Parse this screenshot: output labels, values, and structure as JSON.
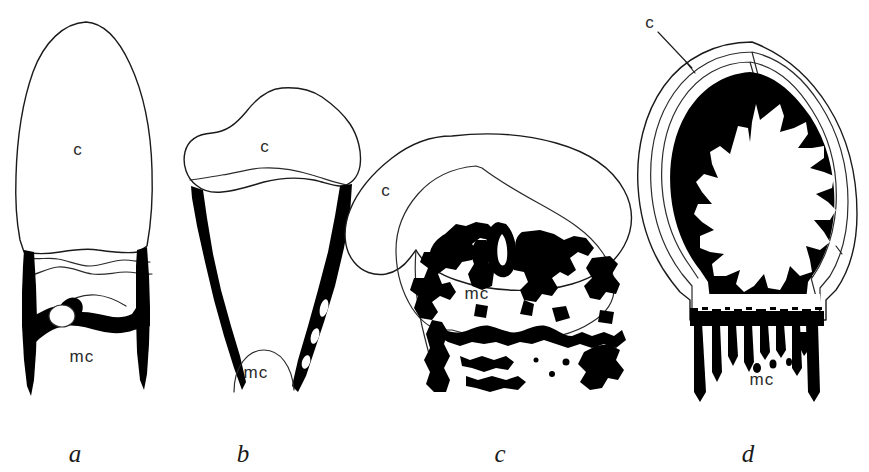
{
  "figure": {
    "background_color": "#ffffff",
    "ink_color": "#000000",
    "width": 869,
    "height": 472,
    "panel_count": 4
  },
  "legend": {
    "c_meaning": "cartilage",
    "mc_meaning": "mineralized cartilage"
  },
  "panels": [
    {
      "letter": "a",
      "letter_x": 75,
      "letter_y": 462,
      "labels": [
        {
          "text": "c",
          "x": 78,
          "y": 155,
          "leader": false
        },
        {
          "text": "mc",
          "x": 66,
          "y": 362,
          "leader": false
        }
      ]
    },
    {
      "letter": "b",
      "letter_x": 243,
      "letter_y": 462,
      "labels": [
        {
          "text": "c",
          "x": 255,
          "y": 150,
          "leader": false
        },
        {
          "text": "mc",
          "x": 238,
          "y": 372,
          "leader": false
        }
      ]
    },
    {
      "letter": "c",
      "letter_x": 500,
      "letter_y": 462,
      "labels": [
        {
          "text": "c",
          "x": 382,
          "y": 196,
          "leader": false
        },
        {
          "text": "mc",
          "x": 461,
          "y": 299,
          "leader": false
        }
      ]
    },
    {
      "letter": "d",
      "letter_x": 748,
      "letter_y": 462,
      "labels": [
        {
          "text": "c",
          "x": 645,
          "y": 28,
          "leader": true
        },
        {
          "text": "mc",
          "x": 731,
          "y": 385,
          "leader": false
        }
      ]
    }
  ],
  "panel_letters": {
    "a": "a",
    "b": "b",
    "c": "c",
    "d": "d"
  },
  "tissue_labels": {
    "cartilage": "c",
    "mineralized_cartilage": "mc"
  }
}
